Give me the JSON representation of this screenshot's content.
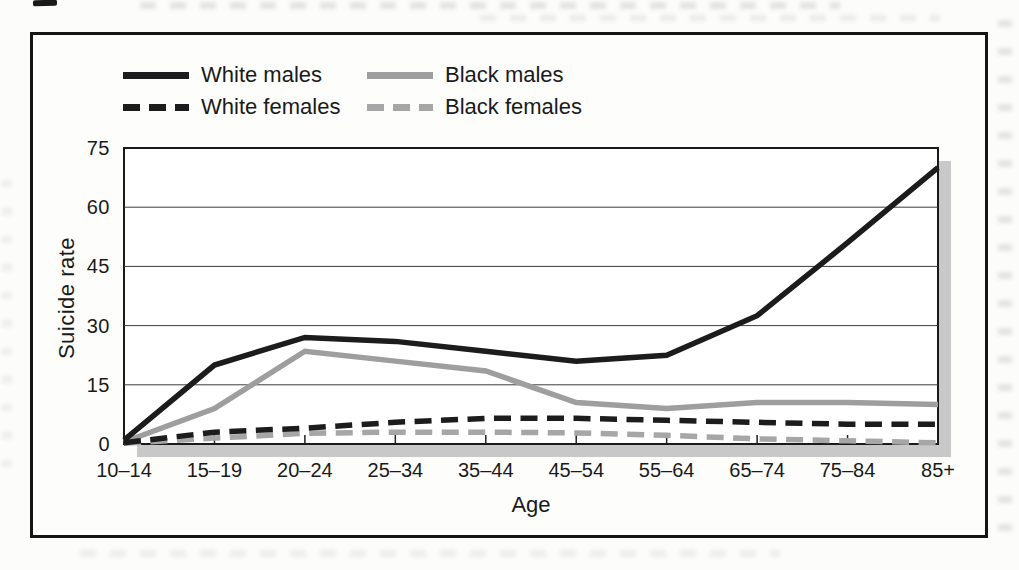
{
  "figure": {
    "kind": "scanned textbook figure",
    "frame_color": "#151515",
    "background": "#fcfcfb",
    "axis_color": "#1a1a1a",
    "gridline_color": "#3c3c3c",
    "shadow_color": "#c8c8c8",
    "text_color": "#1a1a1a"
  },
  "chart_data": {
    "type": "line",
    "title": "",
    "xlabel": "Age",
    "ylabel": "Suicide rate",
    "categories": [
      "10–14",
      "15–19",
      "20–24",
      "25–34",
      "35–44",
      "45–54",
      "55–64",
      "65–74",
      "75–84",
      "85+"
    ],
    "ylim": [
      0,
      75
    ],
    "yticks": [
      0,
      15,
      30,
      45,
      60,
      75
    ],
    "grid": true,
    "legend_position": "above plot, top-left, two columns",
    "series": [
      {
        "name": "White males",
        "line_style": "solid",
        "color": "#1c1c1c",
        "values": [
          1,
          20,
          27,
          26,
          23.5,
          21,
          22.5,
          32.5,
          51,
          70
        ]
      },
      {
        "name": "White females",
        "line_style": "dashed",
        "color": "#1c1c1c",
        "values": [
          0.3,
          3,
          4,
          5.5,
          6.5,
          6.5,
          6,
          5.5,
          5,
          5
        ]
      },
      {
        "name": "Black males",
        "line_style": "solid",
        "color": "#9e9e9e",
        "values": [
          0.5,
          9,
          23.5,
          21,
          18.5,
          10.5,
          9,
          10.5,
          10.5,
          10
        ]
      },
      {
        "name": "Black females",
        "line_style": "dashed",
        "color": "#a6a6a6",
        "values": [
          0.2,
          1.5,
          2.7,
          3,
          3,
          2.8,
          2.2,
          1.3,
          0.8,
          0.3
        ]
      }
    ]
  }
}
